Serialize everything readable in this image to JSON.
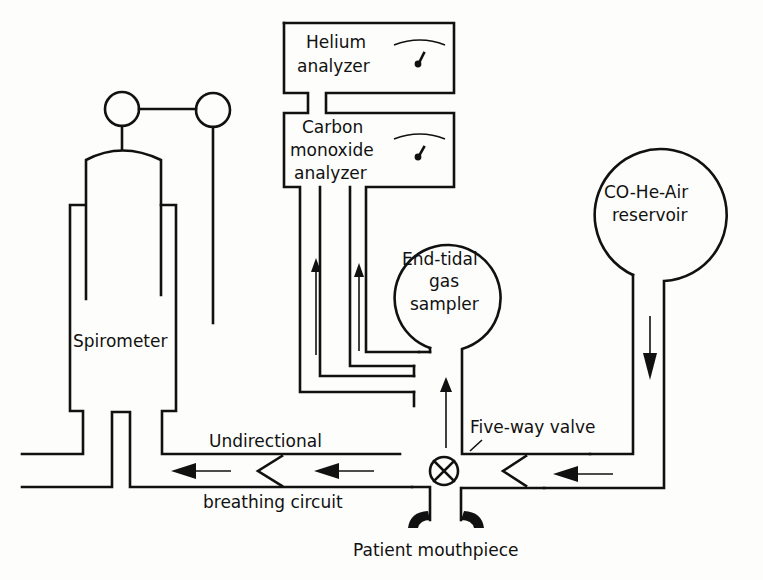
{
  "diagram": {
    "colors": {
      "line": "#111111",
      "background": "#fdfdfb"
    },
    "components": {
      "helium_analyzer": {
        "line1": "Helium",
        "line2": "analyzer",
        "icon": "gauge-icon"
      },
      "co_analyzer": {
        "line1": "Carbon",
        "line2": "monoxide",
        "line3": "analyzer",
        "icon": "gauge-icon"
      },
      "end_tidal": {
        "line1": "End-tidal",
        "line2": "gas",
        "line3": "sampler"
      },
      "reservoir": {
        "line1": "CO-He-Air",
        "line2": "reservoir"
      },
      "spirometer": {
        "label": "Spirometer"
      },
      "circuit": {
        "line1": "Undirectional",
        "line2": "breathing circuit"
      },
      "valve": {
        "label": "Five-way valve",
        "icon": "valve-icon"
      },
      "mouthpiece": {
        "label": "Patient mouthpiece"
      }
    },
    "flow_arrows": [
      "left-from-reservoir",
      "down-from-reservoir",
      "up-to-sampler",
      "up-to-co-analyzer-1",
      "up-to-co-analyzer-2",
      "left-circuit-1",
      "left-circuit-2"
    ]
  }
}
